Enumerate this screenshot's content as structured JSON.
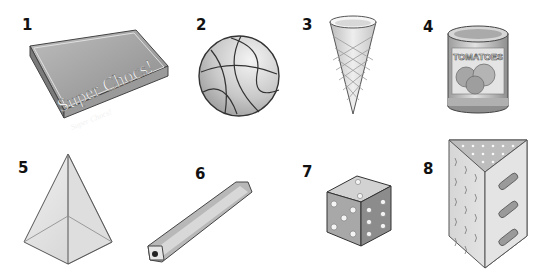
{
  "items": [
    {
      "number": "1",
      "label": "Super Chocs!",
      "sublabel": "Super Chocs!",
      "object": "chocolate-box"
    },
    {
      "number": "2",
      "object": "basketball"
    },
    {
      "number": "3",
      "object": "ice-cream-cone"
    },
    {
      "number": "4",
      "label": "TOMATOES",
      "object": "tomato-can"
    },
    {
      "number": "5",
      "object": "pyramid"
    },
    {
      "number": "6",
      "object": "pencil"
    },
    {
      "number": "7",
      "object": "dice"
    },
    {
      "number": "8",
      "object": "grater"
    }
  ]
}
